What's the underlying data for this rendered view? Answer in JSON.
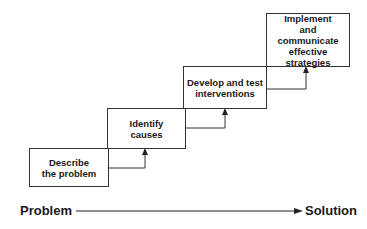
{
  "steps": [
    {
      "label": "Describe\nthe problem"
    },
    {
      "label": "Identify\ncauses"
    },
    {
      "label": "Develop and test\ninterventions"
    },
    {
      "label": "Implement\nand\ncommunicate\neffective strategies"
    }
  ],
  "axis": {
    "start_label": "Problem",
    "end_label": "Solution"
  }
}
